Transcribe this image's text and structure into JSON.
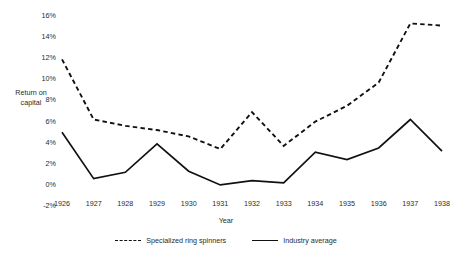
{
  "chart_data": {
    "type": "line",
    "title": "",
    "xlabel": "Year",
    "ylabel": "Return on capital",
    "ylabel_line1": "Return on",
    "ylabel_line2": "capital",
    "categories": [
      "1926",
      "1927",
      "1928",
      "1929",
      "1930",
      "1931",
      "1932",
      "1933",
      "1934",
      "1935",
      "1936",
      "1937",
      "1938"
    ],
    "x": [
      1926,
      1927,
      1928,
      1929,
      1930,
      1931,
      1932,
      1933,
      1934,
      1935,
      1936,
      1937,
      1938
    ],
    "ylim": [
      -2,
      16
    ],
    "ytick_values": [
      -2,
      0,
      2,
      4,
      6,
      8,
      10,
      12,
      14,
      16
    ],
    "ytick_labels": [
      "-2%",
      "0%",
      "2%",
      "4%",
      "6%",
      "8%",
      "10%",
      "12%",
      "14%",
      "16%"
    ],
    "grid": false,
    "legend_position": "bottom",
    "series": [
      {
        "name": "Specialized ring spinners",
        "style": "dashed",
        "color": "#111111",
        "values": [
          11.8,
          6.1,
          5.5,
          5.1,
          4.5,
          3.3,
          6.8,
          3.6,
          5.9,
          7.4,
          9.6,
          15.2,
          15.0
        ]
      },
      {
        "name": "Industry average",
        "style": "solid",
        "color": "#111111",
        "values": [
          4.9,
          0.5,
          1.1,
          3.8,
          1.2,
          -0.1,
          0.3,
          0.1,
          3.0,
          2.3,
          3.4,
          6.1,
          3.1
        ]
      }
    ]
  }
}
